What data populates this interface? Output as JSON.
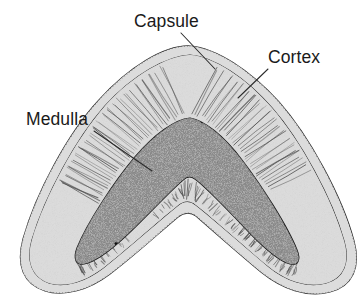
{
  "figure": {
    "name": "thymus-lobule-cross-section",
    "type": "anatomical-cross-section",
    "background_color": "#ffffff",
    "width": 363,
    "height": 306
  },
  "labels": [
    {
      "id": "capsule",
      "text": "Capsule",
      "text_x": 134,
      "text_y": 27,
      "leader": {
        "x1": 181,
        "y1": 33,
        "x2": 215,
        "y2": 69
      }
    },
    {
      "id": "cortex",
      "text": "Cortex",
      "text_x": 268,
      "text_y": 63,
      "leader": {
        "x1": 268,
        "y1": 69,
        "x2": 238,
        "y2": 98
      }
    },
    {
      "id": "medulla",
      "text": "Medulla",
      "text_x": 26,
      "text_y": 125,
      "leader": {
        "x1": 94,
        "y1": 131,
        "x2": 152,
        "y2": 171
      }
    }
  ],
  "regions": [
    {
      "id": "capsule",
      "label": "Capsule",
      "description": "thin fibrous outer covering with hatched tick marks",
      "fill_color": "#d2d2d2",
      "stroke_color": "#2e2e2e"
    },
    {
      "id": "cortex",
      "label": "Cortex",
      "description": "pale outer zone with fine radial striations",
      "fill_color": "#e6e6e6",
      "stroke_color": "#3a3a3a"
    },
    {
      "id": "medulla",
      "label": "Medulla",
      "description": "darker stippled inner zone with irregular black corpuscles",
      "fill_color": "#8c8c8c",
      "stroke_color": "#111111"
    }
  ]
}
